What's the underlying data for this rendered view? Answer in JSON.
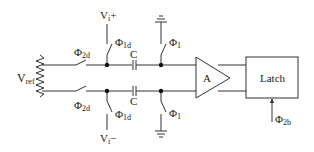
{
  "diagram": {
    "type": "comparator-circuit",
    "labels": {
      "vref": {
        "main": "V",
        "sub": "ref"
      },
      "vi_plus": {
        "main": "V",
        "sub": "i",
        "suffix": "+"
      },
      "vi_minus": {
        "main": "V",
        "sub": "i",
        "suffix": "−"
      },
      "phi2d_top": {
        "main": "Φ",
        "sub": "2d"
      },
      "phi2d_bottom": {
        "main": "Φ",
        "sub": "2d"
      },
      "phi1d_top": {
        "main": "Φ",
        "sub": "1d"
      },
      "phi1d_bottom": {
        "main": "Φ",
        "sub": "1d"
      },
      "phi1_top": {
        "main": "Φ",
        "sub": "1"
      },
      "phi1_bottom": {
        "main": "Φ",
        "sub": "1"
      },
      "phi2b": {
        "main": "Φ",
        "sub": "2b"
      },
      "cap_top": "C",
      "cap_bottom": "C",
      "amplifier": "A",
      "latch": "Latch"
    },
    "components": [
      "resistor-ladder",
      "switch-phi2d-top",
      "switch-phi2d-bottom",
      "switch-phi1d-top",
      "switch-phi1d-bottom",
      "capacitor-top",
      "capacitor-bottom",
      "switch-phi1-top",
      "switch-phi1-bottom",
      "ground-top",
      "ground-bottom",
      "amplifier",
      "latch"
    ],
    "colors": {
      "stroke": "#333333",
      "text": "#222222",
      "background": "#ffffff"
    }
  }
}
